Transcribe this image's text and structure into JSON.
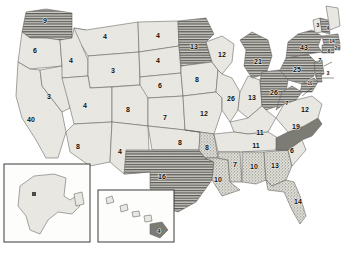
{
  "map": {
    "title": "United States state-level value map",
    "projection_note": "contiguous US with Alaska and Hawaii insets",
    "legend_patterns": {
      "hatched": "horizontal line hatching",
      "solid_dark": "solid dark gray",
      "stippled": "dotted / stippled texture",
      "plain": "plain light gray"
    },
    "colors": {
      "plain_fill": "#e8e7e1",
      "hatch_fill": "#b9b8b2",
      "stipple_fill": "#d6d5cd",
      "solid_dark_fill": "#7c7b74",
      "border": "#5d5d5d",
      "background": "#ffffff",
      "label_text": "#111111"
    },
    "insets": [
      {
        "name": "alaska-inset",
        "label_state": "AK",
        "value": ""
      },
      {
        "name": "hawaii-inset",
        "label_state": "HI",
        "value": "4"
      }
    ],
    "states": [
      {
        "code": "WA",
        "name": "Washington",
        "value": "9",
        "pattern": "hatched",
        "x": 45,
        "y": 21
      },
      {
        "code": "OR",
        "name": "Oregon",
        "value": "6",
        "pattern": "plain",
        "x": 35,
        "y": 51
      },
      {
        "code": "CA",
        "name": "California",
        "value": "40",
        "pattern": "plain",
        "x": 31,
        "y": 120
      },
      {
        "code": "NV",
        "name": "Nevada",
        "value": "3",
        "pattern": "plain",
        "x": 49,
        "y": 97
      },
      {
        "code": "ID",
        "name": "Idaho",
        "value": "4",
        "pattern": "plain",
        "x": 71,
        "y": 61
      },
      {
        "code": "MT",
        "name": "Montana",
        "value": "4",
        "pattern": "plain",
        "x": 105,
        "y": 37
      },
      {
        "code": "WY",
        "name": "Wyoming",
        "value": "3",
        "pattern": "plain",
        "x": 113,
        "y": 71
      },
      {
        "code": "UT",
        "name": "Utah",
        "value": "4",
        "pattern": "plain",
        "x": 85,
        "y": 106
      },
      {
        "code": "AZ",
        "name": "Arizona",
        "value": "8",
        "pattern": "plain",
        "x": 78,
        "y": 147
      },
      {
        "code": "CO",
        "name": "Colorado",
        "value": "8",
        "pattern": "plain",
        "x": 128,
        "y": 110
      },
      {
        "code": "NM",
        "name": "New Mexico",
        "value": "4",
        "pattern": "plain",
        "x": 120,
        "y": 152
      },
      {
        "code": "ND",
        "name": "North Dakota",
        "value": "4",
        "pattern": "plain",
        "x": 158,
        "y": 36
      },
      {
        "code": "SD",
        "name": "South Dakota",
        "value": "4",
        "pattern": "plain",
        "x": 158,
        "y": 61
      },
      {
        "code": "NE",
        "name": "Nebraska",
        "value": "6",
        "pattern": "plain",
        "x": 160,
        "y": 86
      },
      {
        "code": "KS",
        "name": "Kansas",
        "value": "7",
        "pattern": "plain",
        "x": 165,
        "y": 118
      },
      {
        "code": "OK",
        "name": "Oklahoma",
        "value": "8",
        "pattern": "plain",
        "x": 180,
        "y": 143
      },
      {
        "code": "TX",
        "name": "Texas",
        "value": "16",
        "pattern": "hatched",
        "x": 162,
        "y": 177
      },
      {
        "code": "MN",
        "name": "Minnesota",
        "value": "13",
        "pattern": "hatched",
        "x": 194,
        "y": 47
      },
      {
        "code": "IA",
        "name": "Iowa",
        "value": "8",
        "pattern": "plain",
        "x": 197,
        "y": 80
      },
      {
        "code": "MO",
        "name": "Missouri",
        "value": "12",
        "pattern": "plain",
        "x": 204,
        "y": 114
      },
      {
        "code": "AR",
        "name": "Arkansas",
        "value": "8",
        "pattern": "stippled",
        "x": 207,
        "y": 148
      },
      {
        "code": "LA",
        "name": "Louisiana",
        "value": "10",
        "pattern": "stippled",
        "x": 218,
        "y": 180
      },
      {
        "code": "WI",
        "name": "Wisconsin",
        "value": "12",
        "pattern": "plain",
        "x": 222,
        "y": 55
      },
      {
        "code": "IL",
        "name": "Illinois",
        "value": "26",
        "pattern": "plain",
        "x": 231,
        "y": 99
      },
      {
        "code": "IN",
        "name": "Indiana",
        "value": "13",
        "pattern": "plain",
        "x": 252,
        "y": 98
      },
      {
        "code": "MI",
        "name": "Michigan",
        "value": "21",
        "pattern": "hatched",
        "x": 258,
        "y": 62
      },
      {
        "code": "OH",
        "name": "Ohio",
        "value": "26",
        "pattern": "hatched",
        "x": 274,
        "y": 93
      },
      {
        "code": "KY",
        "name": "Kentucky",
        "value": "11",
        "pattern": "plain",
        "x": 260,
        "y": 133
      },
      {
        "code": "TN",
        "name": "Tennessee",
        "value": "11",
        "pattern": "plain",
        "x": 256,
        "y": 146
      },
      {
        "code": "MS",
        "name": "Mississippi",
        "value": "7",
        "pattern": "stippled",
        "x": 235,
        "y": 165
      },
      {
        "code": "AL",
        "name": "Alabama",
        "value": "10",
        "pattern": "stippled",
        "x": 254,
        "y": 167
      },
      {
        "code": "GA",
        "name": "Georgia",
        "value": "13",
        "pattern": "stippled",
        "x": 275,
        "y": 166
      },
      {
        "code": "FL",
        "name": "Florida",
        "value": "14",
        "pattern": "stippled",
        "x": 298,
        "y": 202
      },
      {
        "code": "SC",
        "name": "South Carolina",
        "value": "6",
        "pattern": "plain",
        "x": 292,
        "y": 151
      },
      {
        "code": "NC",
        "name": "North Carolina",
        "value": "19",
        "pattern": "solid_dark",
        "x": 296,
        "y": 127
      },
      {
        "code": "VA",
        "name": "Virginia",
        "value": "12",
        "pattern": "plain",
        "x": 305,
        "y": 110
      },
      {
        "code": "WV",
        "name": "West Virginia",
        "value": "7",
        "pattern": "hatched",
        "x": 287,
        "y": 103
      },
      {
        "code": "PA",
        "name": "Pennsylvania",
        "value": "25",
        "pattern": "hatched",
        "x": 297,
        "y": 70
      },
      {
        "code": "NY",
        "name": "New York",
        "value": "43",
        "pattern": "hatched",
        "x": 304,
        "y": 48
      },
      {
        "code": "VT",
        "name": "Vermont",
        "value": "3",
        "pattern": "plain",
        "x": 318,
        "y": 26
      },
      {
        "code": "NH",
        "name": "New Hampshire",
        "value": "4",
        "pattern": "hatched",
        "x": 328,
        "y": 29
      },
      {
        "code": "MA",
        "name": "Massachusetts",
        "value": "14",
        "pattern": "hatched",
        "x": 332,
        "y": 42
      },
      {
        "code": "CT",
        "name": "Connecticut",
        "value": "8",
        "pattern": "hatched",
        "x": 329,
        "y": 52
      },
      {
        "code": "NJ",
        "name": "New Jersey",
        "value": "7",
        "pattern": "hatched",
        "x": 320,
        "y": 61
      },
      {
        "code": "DE",
        "name": "Delaware",
        "value": "3",
        "pattern": "hatched",
        "x": 328,
        "y": 74
      },
      {
        "code": "MD",
        "name": "Maryland",
        "value": "10",
        "pattern": "hatched",
        "x": 310,
        "y": 84
      },
      {
        "code": "RI",
        "name": "Rhode Island",
        "value": "2",
        "pattern": "hatched",
        "x": 336,
        "y": 49
      }
    ]
  }
}
